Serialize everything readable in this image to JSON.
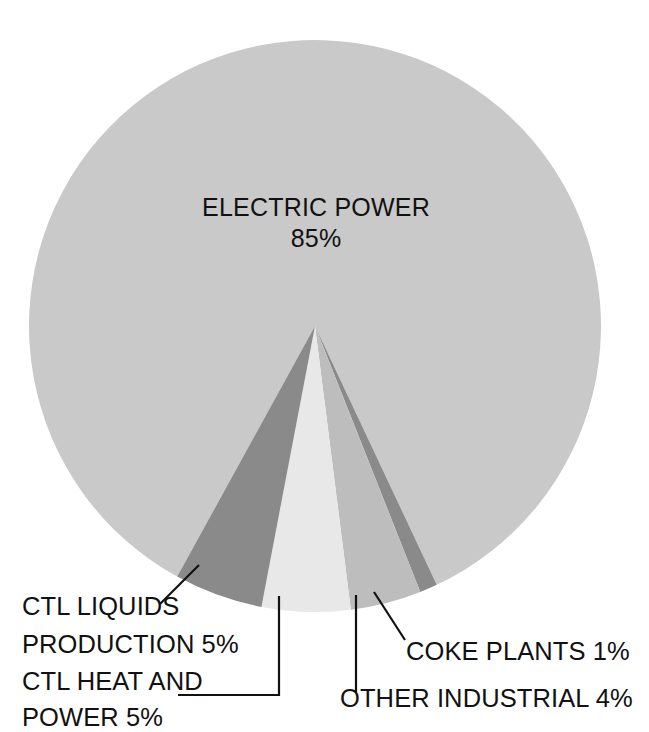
{
  "chart_data": {
    "type": "pie",
    "title": "",
    "subtitle": "",
    "xlabel": "",
    "ylabel": "",
    "legend_position": "none",
    "grid": false,
    "units": "percent",
    "categories": [
      "ELECTRIC POWER",
      "CTL LIQUIDS PRODUCTION",
      "CTL HEAT AND POWER",
      "OTHER INDUSTRIAL",
      "COKE PLANTS"
    ],
    "values": [
      85,
      5,
      5,
      4,
      1
    ],
    "colors": [
      "#c9c9c9",
      "#8a8a8a",
      "#e8e8e8",
      "#bdbdbd",
      "#8a8a8a"
    ],
    "slices": [
      {
        "name": "ELECTRIC POWER",
        "value": 85,
        "value_text": "85%",
        "label": "ELECTRIC POWER",
        "color": "#c9c9c9",
        "label_placement": "inside"
      },
      {
        "name": "CTL LIQUIDS PRODUCTION",
        "value": 5,
        "value_text": "5%",
        "label": "CTL LIQUIDS PRODUCTION 5%",
        "color": "#8a8a8a",
        "label_placement": "callout-bottom-left"
      },
      {
        "name": "CTL HEAT AND POWER",
        "value": 5,
        "value_text": "5%",
        "label": "CTL HEAT AND POWER 5%",
        "color": "#e8e8e8",
        "label_placement": "callout-bottom-left"
      },
      {
        "name": "OTHER INDUSTRIAL",
        "value": 4,
        "value_text": "4%",
        "label": "OTHER INDUSTRIAL 4%",
        "color": "#bdbdbd",
        "label_placement": "callout-bottom-right"
      },
      {
        "name": "COKE PLANTS",
        "value": 1,
        "value_text": "1%",
        "label": "COKE PLANTS  1%",
        "color": "#8a8a8a",
        "label_placement": "callout-bottom-right"
      }
    ]
  },
  "inside_label": {
    "line1": "ELECTRIC POWER",
    "line2": "85%"
  },
  "callouts": {
    "ctl_liquids": {
      "line1": "CTL LIQUIDS",
      "line2": "PRODUCTION 5%"
    },
    "ctl_heat": {
      "line1": "CTL HEAT AND",
      "line2": "POWER 5%"
    },
    "coke_plants": {
      "line1": "COKE PLANTS  1%"
    },
    "other_industrial": {
      "line1": "OTHER INDUSTRIAL 4%"
    }
  },
  "palette": {
    "background": "#ffffff",
    "text": "#111111",
    "electric_power": "#c9c9c9",
    "ctl_liquids": "#8a8a8a",
    "ctl_heat": "#e8e8e8",
    "other_industrial": "#bdbdbd",
    "coke_plants": "#8a8a8a",
    "leader_line": "#111111"
  }
}
